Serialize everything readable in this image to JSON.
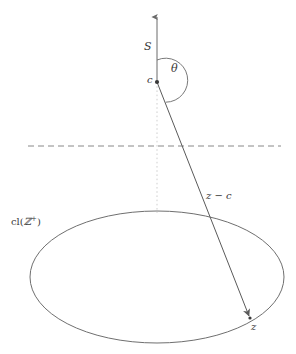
{
  "figure": {
    "background_color": "#ffffff",
    "stroke_color": "#555555",
    "dotted_color": "#cccccc",
    "dashed_color": "#777777",
    "width": 296,
    "height": 354
  },
  "labels": {
    "ray_label": "S",
    "angle_label": "θ",
    "apex_label": "c",
    "vector_label": "z − c",
    "set_label_prefix": "cl(",
    "set_label_symbol": "ℤ",
    "set_label_superscript": "+",
    "set_label_suffix": ")",
    "target_point_label": "z"
  },
  "geometry": {
    "apex_point": {
      "x": 157,
      "y": 82
    },
    "target_point": {
      "x": 250,
      "y": 318
    },
    "ray_tip": {
      "x": 157,
      "y": 14
    },
    "vertical_dotted_bottom": {
      "x": 157,
      "y": 213
    },
    "dashed_line": {
      "x1": 28,
      "y1": 146,
      "x2": 281,
      "y2": 146
    },
    "ellipse": {
      "cx": 157,
      "cy": 277,
      "rx": 127,
      "ry": 66
    },
    "angle_arc_radius": 22,
    "angle_degrees": 202
  },
  "elements": {
    "upward_ray": "upward-ray-S",
    "angle_arc": "angle-arc-theta",
    "apex_dot": "apex-point-c",
    "vector_line": "vector-line-z-minus-c",
    "target_dot": "target-point-z",
    "horizontal_dashed": "horizontal-dashed-line",
    "vertical_dotted": "vertical-dotted-axis",
    "base_ellipse": "closure-set-ellipse"
  }
}
